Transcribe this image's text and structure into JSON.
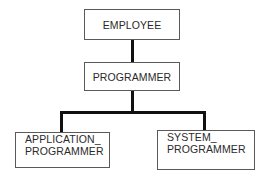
{
  "diagram": {
    "type": "class-hierarchy",
    "nodes": [
      {
        "id": "employee",
        "lines": [
          "EMPLOYEE"
        ]
      },
      {
        "id": "programmer",
        "lines": [
          "PROGRAMMER"
        ]
      },
      {
        "id": "application_programmer",
        "lines": [
          "APPLICATION_",
          "PROGRAMMER"
        ]
      },
      {
        "id": "system_programmer",
        "lines": [
          "SYSTEM_",
          "PROGRAMMER"
        ]
      }
    ],
    "edges": [
      {
        "from": "employee",
        "to": "programmer"
      },
      {
        "from": "programmer",
        "to": "application_programmer"
      },
      {
        "from": "programmer",
        "to": "system_programmer"
      }
    ],
    "colors": {
      "line": "#111111",
      "box_border": "#5a5a5a",
      "text": "#2a2a2a"
    }
  }
}
